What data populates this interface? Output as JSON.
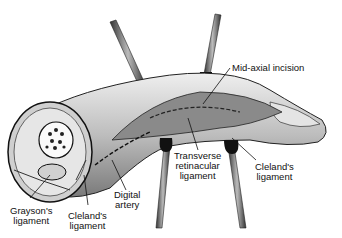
{
  "figure": {
    "type": "anatomical illustration"
  },
  "labels": {
    "mid_axial_incision": "Mid-axial incision",
    "transverse_retinacular_1": "Transverse",
    "transverse_retinacular_2": "retinacular",
    "transverse_retinacular_3": "ligament",
    "clelands_right_1": "Cleland's",
    "clelands_right_2": "ligament",
    "digital_artery_1": "Digital",
    "digital_artery_2": "artery",
    "graysons_1": "Grayson's",
    "graysons_2": "ligament",
    "clelands_left_1": "Cleland's",
    "clelands_left_2": "ligament"
  },
  "colors": {
    "ink": "#111111",
    "skin": "#d8d8d8",
    "shade": "#9a9a9a",
    "background": "#ffffff"
  }
}
